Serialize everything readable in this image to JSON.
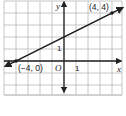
{
  "chart_data": {
    "type": "line",
    "title": "",
    "xlabel": "x",
    "ylabel": "y",
    "origin_label": "O",
    "x_tick_label": "1",
    "y_tick_label": "1",
    "xlim": [
      -5,
      5
    ],
    "ylim": [
      -3,
      5
    ],
    "grid": true,
    "series": [
      {
        "name": "line",
        "points": [
          {
            "x": -4,
            "y": 0,
            "label": "(−4, 0)"
          },
          {
            "x": 4,
            "y": 4,
            "label": "(4, 4)"
          }
        ],
        "slope": 0.5,
        "y_intercept": 2
      }
    ]
  },
  "colors": {
    "grid": "#b8b8b8",
    "axis": "#222222",
    "line": "#1a1a1a"
  }
}
